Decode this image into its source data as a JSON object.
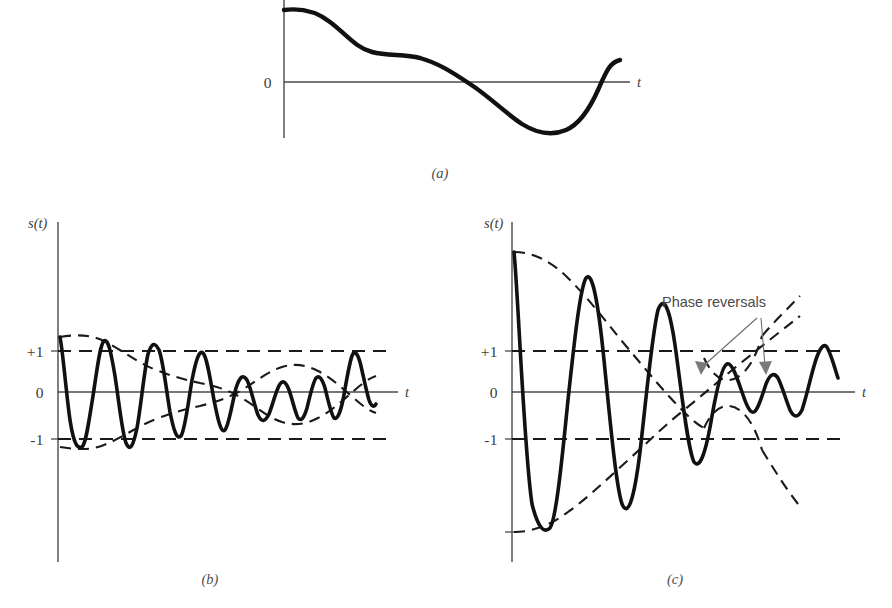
{
  "figure": {
    "background": "#ffffff",
    "curve_color": "#111111",
    "axis_color": "#4a4a4a",
    "dash_color": "#1a1a1a",
    "annotation_color": "#6d6d6d"
  },
  "panels": [
    {
      "id": "a",
      "label": "(a)",
      "label_pos": {
        "x": 440,
        "y": 178
      },
      "yaxis": {
        "x": 284,
        "y_top": 0,
        "y_bottom": 138
      },
      "taxis": {
        "y": 82,
        "x_start": 284,
        "x_end": 630
      },
      "taxis_label": "t",
      "taxis_label_pos": {
        "x": 637,
        "y": 87
      },
      "yaxis_label": "",
      "ticks": [
        {
          "label": "0",
          "x": 272,
          "y": 88
        }
      ],
      "reference_lines": [],
      "envelopes": [],
      "curve": "M 284,10 C 300,8 316,11 330,22 C 346,34 356,48 372,52 C 388,56 404,54 420,58 C 438,63 452,72 470,84 C 490,97 504,112 522,124 C 538,134 552,136 566,130 C 580,124 590,108 598,90 C 606,72 610,62 620,60"
    },
    {
      "id": "b",
      "label": "(b)",
      "label_pos": {
        "x": 210,
        "y": 584
      },
      "yaxis": {
        "x": 58,
        "y_top": 222,
        "y_bottom": 562
      },
      "taxis": {
        "y": 392,
        "x_start": 58,
        "x_end": 398
      },
      "taxis_label": "t",
      "taxis_label_pos": {
        "x": 405,
        "y": 397
      },
      "yaxis_label": "s(t)",
      "yaxis_label_pos": {
        "x": 28,
        "y": 228
      },
      "ticks": [
        {
          "label": "+1",
          "x": 28,
          "y": 357,
          "line_y": 351
        },
        {
          "label": "0",
          "x": 38,
          "y": 398,
          "line_y": 392
        },
        {
          "label": "-1",
          "x": 30,
          "y": 445,
          "line_y": 439
        }
      ],
      "reference_lines": [
        {
          "value": 1,
          "y": 351,
          "x_start": 58,
          "x_end": 392
        },
        {
          "value": -1,
          "y": 439,
          "x_start": 58,
          "x_end": 392
        }
      ],
      "envelope_upper": "M 60,337 C 78,334 92,335 104,341 C 122,350 136,362 156,370 C 174,377 186,380 200,383 C 216,386 228,390 240,397 C 256,406 266,417 282,422 C 296,426 306,424 318,418 C 332,411 344,399 356,389 C 364,382 370,378 376,376",
      "envelope_lower": "M 60,447 C 78,450 92,450 104,445 C 122,438 136,427 156,419 C 174,412 186,409 200,406 C 216,402 228,398 240,391 C 256,382 266,372 282,367 C 296,363 306,365 318,371 C 332,378 344,390 356,400 C 364,407 370,411 376,413",
      "curve": "M 60,337 C 63,352 66,392 70,420 C 74,446 78,449 82,447 C 86,444 89,420 93,396 C 97,370 100,344 104,341 C 108,338 111,352 115,376 C 119,402 122,432 126,443 C 130,452 133,447 137,428 C 141,406 144,372 148,354 C 152,342 155,342 159,350 C 163,360 166,388 170,412 C 174,432 177,440 181,436 C 185,430 188,404 192,380 C 196,360 199,350 203,353 C 207,357 210,378 214,400 C 218,420 221,434 225,430 C 229,425 232,404 236,388 C 240,376 243,374 247,380 C 251,388 254,404 258,415 C 262,423 265,422 269,414 C 273,404 276,390 280,384 C 283,380 286,382 289,390 C 292,398 295,412 298,418 C 301,422 304,418 307,408 C 310,396 313,382 316,378 C 319,375 322,378 325,388 C 328,400 331,414 334,418 C 337,420 340,414 343,400 C 346,384 349,364 352,356 C 354,350 357,352 360,362 C 363,374 366,390 369,400 C 371,406 374,408 376,404"
    },
    {
      "id": "c",
      "label": "(c)",
      "label_pos": {
        "x": 675,
        "y": 584
      },
      "yaxis": {
        "x": 512,
        "y_top": 222,
        "y_bottom": 562
      },
      "taxis": {
        "y": 392,
        "x_start": 512,
        "x_end": 855
      },
      "taxis_label": "t",
      "taxis_label_pos": {
        "x": 862,
        "y": 397
      },
      "yaxis_label": "s(t)",
      "yaxis_label_pos": {
        "x": 484,
        "y": 228
      },
      "ticks": [
        {
          "label": "+1",
          "x": 482,
          "y": 357,
          "line_y": 351
        },
        {
          "label": "0",
          "x": 492,
          "y": 398,
          "line_y": 392
        },
        {
          "label": "-1",
          "x": 484,
          "y": 445,
          "line_y": 439
        }
      ],
      "reference_lines": [
        {
          "value": 1,
          "y": 351,
          "x_start": 512,
          "x_end": 848
        },
        {
          "value": -1,
          "y": 439,
          "x_start": 512,
          "x_end": 848
        }
      ],
      "envelope_upper": "M 514,252 C 534,252 552,262 568,278 C 590,300 606,322 626,346 C 648,372 664,392 684,412 C 700,428 714,438 728,442",
      "envelope_lower": "M 514,532 C 534,532 552,524 568,512 C 590,496 606,480 626,462 C 648,442 664,426 684,410 C 704,394 722,378 742,362 C 762,346 782,330 800,316",
      "envelope_lobe_upper": "M 700,424 C 712,404 726,400 740,412 C 752,422 758,436 762,448",
      "envelope_lobe_lower": "M 700,360 C 712,380 726,384 740,372 C 752,362 758,348 762,336",
      "envelope_tail": "M 700,308 C 714,330 730,358 748,386 C 766,414 784,444 798,470",
      "curve": "M 514,252 C 518,290 524,452 532,504 C 538,528 544,534 550,528 C 556,520 562,460 568,400 C 574,344 580,288 586,278 C 592,270 598,300 604,360 C 610,420 616,486 622,504 C 628,518 634,500 640,452 C 646,400 652,334 658,310 C 664,294 670,308 676,352 C 682,396 688,450 694,462 C 700,470 706,452 712,416 C 717,388 722,366 727,364 C 732,362 737,378 742,392 C 746,404 750,414 754,412 C 758,410 762,396 766,384 C 770,374 774,372 778,378 C 782,386 786,400 790,410 C 794,418 798,418 802,410 C 806,398 810,380 814,366 C 818,352 822,344 826,346 C 830,350 834,366 838,378",
      "annotation": {
        "text": "Phase reversals",
        "text_pos": {
          "x": 714,
          "y": 305
        },
        "leaders": [
          {
            "from": {
              "x": 758,
              "y": 316
            },
            "to": {
              "x": 700,
              "y": 372
            }
          },
          {
            "from": {
              "x": 764,
              "y": 316
            },
            "to": {
              "x": 764,
              "y": 372
            }
          }
        ]
      }
    }
  ]
}
